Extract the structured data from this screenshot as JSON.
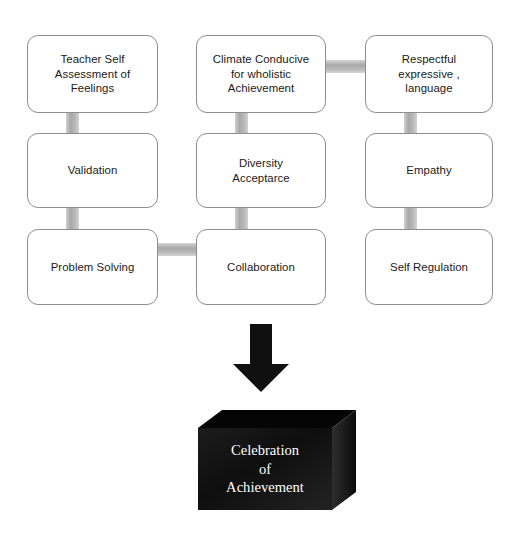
{
  "diagram": {
    "type": "flowchart",
    "colors": {
      "node_border": "#8e8e8e",
      "node_fill": "#ffffff",
      "connector": "#b0b0b0",
      "arrow": "#101010",
      "cube_front": "#121212",
      "cube_top": "#000000",
      "cube_side": "#2a2a2a",
      "cube_text": "#ffffff"
    },
    "grid": {
      "columns": [
        "left",
        "middle",
        "right"
      ],
      "rows": [
        "row-1",
        "row-2",
        "row-3"
      ]
    },
    "nodes": [
      {
        "id": "teacher-self-assessment",
        "label": "Teacher Self\nAssessment of\nFeelings",
        "column": "left",
        "row": "row-1"
      },
      {
        "id": "climate-conducive",
        "label": "Climate Conducive\nfor wholistic\nAchievement",
        "column": "middle",
        "row": "row-1"
      },
      {
        "id": "respectful-expressive-language",
        "label": "Respectful\nexpressive ,\nlanguage",
        "column": "right",
        "row": "row-1"
      },
      {
        "id": "validation",
        "label": "Validation",
        "column": "left",
        "row": "row-2"
      },
      {
        "id": "diversity-acceptance",
        "label": "Diversity\nAcceptarce",
        "column": "middle",
        "row": "row-2"
      },
      {
        "id": "empathy",
        "label": "Empathy",
        "column": "right",
        "row": "row-2"
      },
      {
        "id": "problem-solving",
        "label": "Problem Solving",
        "column": "left",
        "row": "row-3"
      },
      {
        "id": "collaboration",
        "label": "Collaboration",
        "column": "middle",
        "row": "row-3"
      },
      {
        "id": "self-regulation",
        "label": "Self Regulation",
        "column": "right",
        "row": "row-3"
      }
    ],
    "connectors": [
      {
        "from": "teacher-self-assessment",
        "to": "validation",
        "orientation": "vertical"
      },
      {
        "from": "validation",
        "to": "problem-solving",
        "orientation": "vertical"
      },
      {
        "from": "climate-conducive",
        "to": "diversity-acceptance",
        "orientation": "vertical"
      },
      {
        "from": "diversity-acceptance",
        "to": "collaboration",
        "orientation": "vertical"
      },
      {
        "from": "respectful-expressive-language",
        "to": "empathy",
        "orientation": "vertical"
      },
      {
        "from": "empathy",
        "to": "self-regulation",
        "orientation": "vertical"
      },
      {
        "from": "climate-conducive",
        "to": "respectful-expressive-language",
        "orientation": "horizontal"
      },
      {
        "from": "problem-solving",
        "to": "collaboration",
        "orientation": "horizontal"
      }
    ],
    "arrow": {
      "id": "down-arrow",
      "direction": "down",
      "from": "collaboration",
      "to": "celebration-cube"
    },
    "outcome": {
      "id": "celebration-cube",
      "shape": "3d-cube",
      "lines": [
        "Celebration",
        "of",
        "Achievement"
      ]
    }
  }
}
